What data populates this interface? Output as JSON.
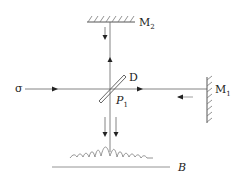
{
  "diagram": {
    "labels": {
      "mirror2": "M",
      "mirror2_sub": "2",
      "mirror1": "M",
      "mirror1_sub": "1",
      "splitter": "D",
      "plate": "P",
      "plate_sub": "1",
      "source": "σ",
      "screen": "B"
    },
    "colors": {
      "line": "#444444",
      "light_line": "#888888"
    }
  }
}
